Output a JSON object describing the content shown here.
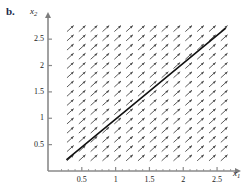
{
  "figure": {
    "panel_label": "b.",
    "panel_label_color": "#1b2a4a",
    "background": "#ffffff",
    "type": "direction-field"
  },
  "axes": {
    "x": {
      "label": "x",
      "label_sub": "1",
      "ticks": [
        0.5,
        1,
        1.5,
        2,
        2.5
      ],
      "tick_labels": [
        "0.5",
        "1",
        "1.5",
        "2",
        "2.5"
      ],
      "range": [
        0.12,
        2.78
      ],
      "arrow": true,
      "color": "#8a8a8a"
    },
    "y": {
      "label": "x",
      "label_sub": "2",
      "ticks": [
        0.5,
        1,
        1.5,
        2,
        2.5
      ],
      "tick_labels": [
        "0.5",
        "1",
        "1.5",
        "2",
        "2.5"
      ],
      "range": [
        0.1,
        2.9
      ],
      "arrow": true,
      "color": "#8a8a8a"
    }
  },
  "chart_data": {
    "type": "line",
    "title": "b.",
    "xlabel": "x1",
    "ylabel": "x2",
    "xlim": [
      0.12,
      2.78
    ],
    "ylim": [
      0.1,
      2.9
    ],
    "xticks": [
      0.5,
      1,
      1.5,
      2,
      2.5
    ],
    "yticks": [
      0.5,
      1,
      1.5,
      2,
      2.5
    ],
    "grid": false,
    "legend": "none",
    "series": [
      {
        "name": "trajectory",
        "kind": "line",
        "color": "#111111",
        "linewidth": 1.6,
        "x": [
          0.28,
          2.62
        ],
        "y": [
          0.22,
          2.7
        ]
      }
    ],
    "vector_field": {
      "name": "direction-field",
      "glyph": "arrow",
      "color": "#4a4a4a",
      "angle_deg": 42,
      "columns": 14,
      "rows": 15,
      "x_start": 0.33,
      "x_step": 0.175,
      "y_start": 0.25,
      "y_step": 0.175,
      "arrow_length": 9,
      "description": "uniform arrows pointing up and to the right at about 42 degrees"
    }
  }
}
